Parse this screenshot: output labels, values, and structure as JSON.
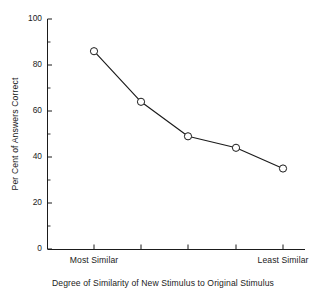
{
  "chart_data": {
    "type": "line",
    "title": "",
    "xlabel": "Degree of Similarity of New Stimulus to Original Stimulus",
    "ylabel": "Per Cent of Answers Correct",
    "categories": [
      "Most Similar",
      "",
      "",
      "",
      "Least Similar"
    ],
    "x": [
      1,
      2,
      3,
      4,
      5
    ],
    "values": [
      86,
      64,
      49,
      44,
      35
    ],
    "series": [
      {
        "name": "Per Cent of Answers Correct",
        "values": [
          86,
          64,
          49,
          44,
          35
        ]
      }
    ],
    "ylim": [
      0,
      100
    ],
    "ytick_labels": [
      "0",
      "20",
      "40",
      "60",
      "80",
      "100"
    ],
    "ytick_values": [
      0,
      20,
      40,
      60,
      80,
      100
    ],
    "yminor_values": [
      10,
      30,
      50,
      70,
      90
    ],
    "xtick_count": 5,
    "xtick_labels_visible": [
      "Most Similar",
      "Least Similar"
    ],
    "grid": false,
    "legend": false,
    "legend_position": "none",
    "marker": "open-circle",
    "line_color": "#1b1b1b",
    "marker_face_color": "#ffffff",
    "marker_edge_color": "#1b1b1b",
    "background_color": "#ffffff"
  },
  "axes": {
    "y_label": "Per Cent of Answers Correct",
    "x_label": "Degree of Similarity of New Stimulus to Original Stimulus",
    "y_ticks": [
      {
        "label": "100",
        "value": 100
      },
      {
        "label": "80",
        "value": 80
      },
      {
        "label": "60",
        "value": 60
      },
      {
        "label": "40",
        "value": 40
      },
      {
        "label": "20",
        "value": 20
      },
      {
        "label": "0",
        "value": 0
      }
    ],
    "x_ticks": [
      {
        "label": "Most Similar",
        "index": 1
      },
      {
        "label": "",
        "index": 2
      },
      {
        "label": "",
        "index": 3
      },
      {
        "label": "",
        "index": 4
      },
      {
        "label": "Least Similar",
        "index": 5
      }
    ]
  }
}
